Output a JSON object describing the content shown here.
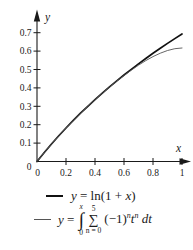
{
  "figure": {
    "background": "#ffffff",
    "axis_color": "#1a1a1a"
  },
  "axes": {
    "y_label": "y",
    "x_label": "x",
    "origin_y_label": "0",
    "origin_x_label": "0",
    "y_ticks": [
      {
        "v": 0.1,
        "label": "0.1"
      },
      {
        "v": 0.2,
        "label": "0.2"
      },
      {
        "v": 0.3,
        "label": "0.3"
      },
      {
        "v": 0.4,
        "label": "0.4"
      },
      {
        "v": 0.5,
        "label": "0.5"
      },
      {
        "v": 0.6,
        "label": "0.6"
      },
      {
        "v": 0.7,
        "label": "0.7"
      }
    ],
    "x_ticks": [
      {
        "v": 0.2,
        "label": "0.2"
      },
      {
        "v": 0.4,
        "label": "0.4"
      },
      {
        "v": 0.6,
        "label": "0.6"
      },
      {
        "v": 0.8,
        "label": "0.8"
      },
      {
        "v": 1.0,
        "label": "1"
      }
    ]
  },
  "chart_data": {
    "type": "line",
    "title": "",
    "xlabel": "x",
    "ylabel": "y",
    "xlim": [
      0,
      1.05
    ],
    "ylim": [
      0,
      0.78
    ],
    "grid": false,
    "legend_position": "below",
    "x": [
      0,
      0.05,
      0.1,
      0.15,
      0.2,
      0.25,
      0.3,
      0.35,
      0.4,
      0.45,
      0.5,
      0.55,
      0.6,
      0.65,
      0.7,
      0.75,
      0.8,
      0.85,
      0.9,
      0.95,
      1.0
    ],
    "series": [
      {
        "name": "y = ln(1 + x)",
        "color": "#111111",
        "width": 1.7,
        "values": [
          0,
          0.0488,
          0.0953,
          0.1398,
          0.1823,
          0.2231,
          0.2624,
          0.3001,
          0.3365,
          0.3716,
          0.4055,
          0.4383,
          0.47,
          0.5008,
          0.5306,
          0.5596,
          0.5878,
          0.6152,
          0.6419,
          0.6678,
          0.6931
        ]
      },
      {
        "name": "y = ∫₀^x ∑_{n=0}^{5} (−1)^n t^n dt",
        "color": "#555555",
        "width": 0.9,
        "values": [
          0,
          0.0488,
          0.0953,
          0.1398,
          0.1823,
          0.2231,
          0.2623,
          0.3,
          0.3363,
          0.3712,
          0.4047,
          0.4368,
          0.4674,
          0.4963,
          0.5233,
          0.5481,
          0.5701,
          0.5888,
          0.6035,
          0.6132,
          0.6167
        ]
      }
    ]
  },
  "legend": {
    "entry1": {
      "part_y": "y",
      "part_mid": " = ln(1 + ",
      "part_x": "x",
      "part_close": ")"
    },
    "entry2": {
      "part_y": "y",
      "part_eq": " = ",
      "int_sign": "∫",
      "int_upper": "x",
      "int_lower": "0",
      "sum_sign": "∑",
      "sum_upper": "5",
      "sum_lower": "n = 0",
      "base": "(−1)",
      "exp1": "n",
      "t": "t",
      "exp2": "n",
      "dt": "dt"
    }
  }
}
